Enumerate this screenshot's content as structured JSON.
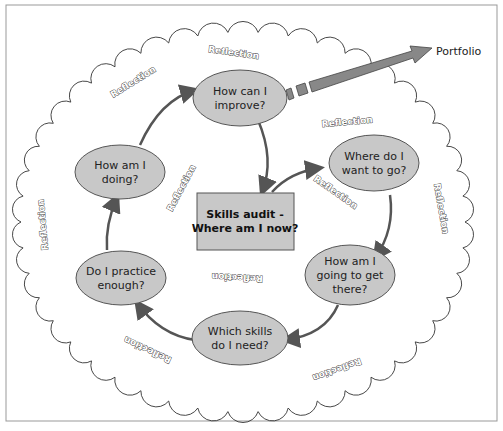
{
  "diagram": {
    "center": {
      "line1": "Skills audit -",
      "line2": "Where am I now?"
    },
    "nodes": [
      {
        "id": "improve",
        "line1": "How can I",
        "line2": "improve?"
      },
      {
        "id": "where",
        "line1": "Where do I",
        "line2": "want to go?"
      },
      {
        "id": "howget",
        "line1": "How am I",
        "line2": "going to get",
        "line3": "there?"
      },
      {
        "id": "skills",
        "line1": "Which skills",
        "line2": "do I need?"
      },
      {
        "id": "practice",
        "line1": "Do I practice",
        "line2": "enough?"
      },
      {
        "id": "doing",
        "line1": "How am I",
        "line2": "doing?"
      }
    ],
    "output_label": "Portfolio",
    "reflection_label": "Reflection",
    "colors": {
      "node_fill": "#c8c8c8",
      "arrow": "#555555",
      "border": "#999999"
    }
  }
}
